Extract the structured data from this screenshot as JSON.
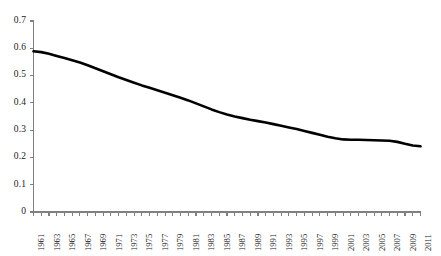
{
  "chart_data": {
    "type": "line",
    "title": "",
    "subtitle": "",
    "xlabel": "",
    "ylabel": "",
    "grid": false,
    "legend": "none",
    "legend_entries": [],
    "annotations": [],
    "line_color": "#000000",
    "axis_color": "#808080",
    "xlim": [
      1961,
      2011
    ],
    "ylim": [
      0,
      0.7
    ],
    "ytick_values": [
      0,
      0.1,
      0.2,
      0.3,
      0.4,
      0.5,
      0.6,
      0.7
    ],
    "ytick_labels": [
      "0",
      "0.1",
      "0.2",
      "0.3",
      "0.4",
      "0.5",
      "0.6",
      "0.7"
    ],
    "xtick_labels": [
      "1961",
      "1963",
      "1965",
      "1967",
      "1969",
      "1971",
      "1973",
      "1975",
      "1977",
      "1979",
      "1981",
      "1983",
      "1985",
      "1987",
      "1989",
      "1991",
      "1993",
      "1995",
      "1997",
      "1999",
      "2001",
      "2003",
      "2005",
      "2007",
      "2009",
      "2011"
    ],
    "x": [
      1961,
      1962,
      1963,
      1964,
      1965,
      1966,
      1967,
      1968,
      1969,
      1970,
      1971,
      1972,
      1973,
      1974,
      1975,
      1976,
      1977,
      1978,
      1979,
      1980,
      1981,
      1982,
      1983,
      1984,
      1985,
      1986,
      1987,
      1988,
      1989,
      1990,
      1991,
      1992,
      1993,
      1994,
      1995,
      1996,
      1997,
      1998,
      1999,
      2000,
      2001,
      2002,
      2003,
      2004,
      2005,
      2006,
      2007,
      2008,
      2009,
      2010,
      2011
    ],
    "values": [
      0.589,
      0.586,
      0.58,
      0.572,
      0.564,
      0.556,
      0.548,
      0.538,
      0.527,
      0.516,
      0.505,
      0.494,
      0.484,
      0.474,
      0.464,
      0.455,
      0.446,
      0.437,
      0.428,
      0.419,
      0.409,
      0.398,
      0.387,
      0.376,
      0.366,
      0.357,
      0.35,
      0.344,
      0.338,
      0.333,
      0.328,
      0.322,
      0.316,
      0.31,
      0.304,
      0.297,
      0.29,
      0.283,
      0.276,
      0.27,
      0.266,
      0.265,
      0.265,
      0.264,
      0.263,
      0.262,
      0.261,
      0.257,
      0.25,
      0.244,
      0.241
    ]
  }
}
